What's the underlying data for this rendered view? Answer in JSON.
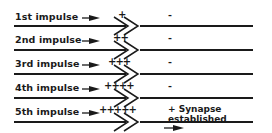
{
  "diagram": {
    "rows": [
      {
        "label": "1st impulse",
        "charge": "+",
        "result": "-"
      },
      {
        "label": "2nd impulse",
        "charge": "++",
        "result": "-"
      },
      {
        "label": "3rd impulse",
        "charge": "+++",
        "result": "-"
      },
      {
        "label": "4th impulse",
        "charge": "++++",
        "result": "-"
      },
      {
        "label": "5th impulse",
        "charge": "+++++",
        "result": "+ Synapse established"
      }
    ],
    "icons": {
      "impulse_arrow": "arrow-right-icon",
      "synapse": "double-chevron-icon",
      "transmission_arrow": "arrow-right-icon"
    },
    "colors": {
      "ink": "#1a1a1a",
      "background": "#ffffff"
    }
  }
}
